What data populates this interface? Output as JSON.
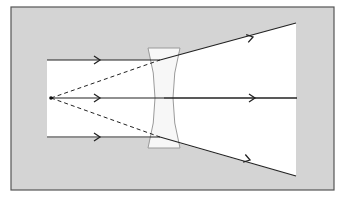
{
  "figure": {
    "type": "ray-diagram",
    "caption_fragment": "",
    "colors": {
      "page_background": "#ffffff",
      "frame_fill": "#d4d4d4",
      "frame_border": "#555555",
      "beam_region": "#ffffff",
      "lens_fill": "#f7f7f7",
      "lens_border": "#9a9a9a",
      "ray": "#222222",
      "virtual_ray": "#222222"
    },
    "frame": {
      "x": 11,
      "y": 7,
      "width": 323,
      "height": 183
    },
    "beam_region_points": [
      [
        47,
        60
      ],
      [
        160,
        60
      ],
      [
        296,
        23
      ],
      [
        296,
        176
      ],
      [
        160,
        138
      ],
      [
        47,
        138
      ]
    ],
    "lens": {
      "top_y": 48,
      "bottom_y": 148,
      "outer_left_x": 148,
      "outer_right_x": 180,
      "waist_left_x": 158,
      "waist_right_x": 170,
      "center_x": 164
    },
    "virtual_focus": {
      "x": 51,
      "y": 98
    },
    "incoming_rays": [
      {
        "name": "upper",
        "x1": 47,
        "y1": 60,
        "x2": 160,
        "y2": 60,
        "arrow_x": 100
      },
      {
        "name": "axis",
        "x1": 51,
        "y1": 98,
        "x2": 297,
        "y2": 98,
        "arrow_x": 100
      },
      {
        "name": "lower",
        "x1": 47,
        "y1": 137,
        "x2": 160,
        "y2": 137,
        "arrow_x": 100
      }
    ],
    "outgoing_rays": [
      {
        "name": "upper",
        "x1": 160,
        "y1": 60,
        "x2": 296,
        "y2": 23,
        "arrow_x": 253,
        "arrow_y": 37
      },
      {
        "name": "axis",
        "x1": 164,
        "y1": 98,
        "x2": 297,
        "y2": 98,
        "arrow_x": 255,
        "arrow_y": 98
      },
      {
        "name": "lower",
        "x1": 160,
        "y1": 137,
        "x2": 296,
        "y2": 176,
        "arrow_x": 250,
        "arrow_y": 160
      }
    ],
    "virtual_rays": [
      {
        "name": "upper-extension",
        "x1": 51,
        "y1": 98,
        "x2": 160,
        "y2": 60,
        "style": "dashed"
      },
      {
        "name": "lower-extension",
        "x1": 51,
        "y1": 98,
        "x2": 160,
        "y2": 137,
        "style": "dashed"
      }
    ]
  }
}
